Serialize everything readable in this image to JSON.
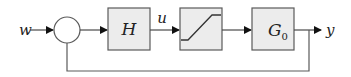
{
  "diagram": {
    "type": "block-diagram",
    "input_label": "w",
    "output_label": "y",
    "signal_labels": {
      "controller_output": "u"
    },
    "blocks": [
      {
        "id": "H",
        "label": "H",
        "kind": "controller"
      },
      {
        "id": "sat",
        "label": "",
        "kind": "saturation"
      },
      {
        "id": "G0",
        "label": "G",
        "subscript": "0",
        "kind": "plant"
      }
    ],
    "summing_junction": {
      "inputs": [
        "w",
        "feedback"
      ]
    },
    "connections": [
      [
        "w",
        "sum"
      ],
      [
        "sum",
        "H"
      ],
      [
        "H",
        "sat"
      ],
      [
        "sat",
        "G0"
      ],
      [
        "G0",
        "y"
      ],
      [
        "y",
        "sum"
      ]
    ],
    "colors": {
      "block_fill": "#ececec",
      "stroke": "#4a4a4a",
      "arrow": "#111111"
    }
  }
}
